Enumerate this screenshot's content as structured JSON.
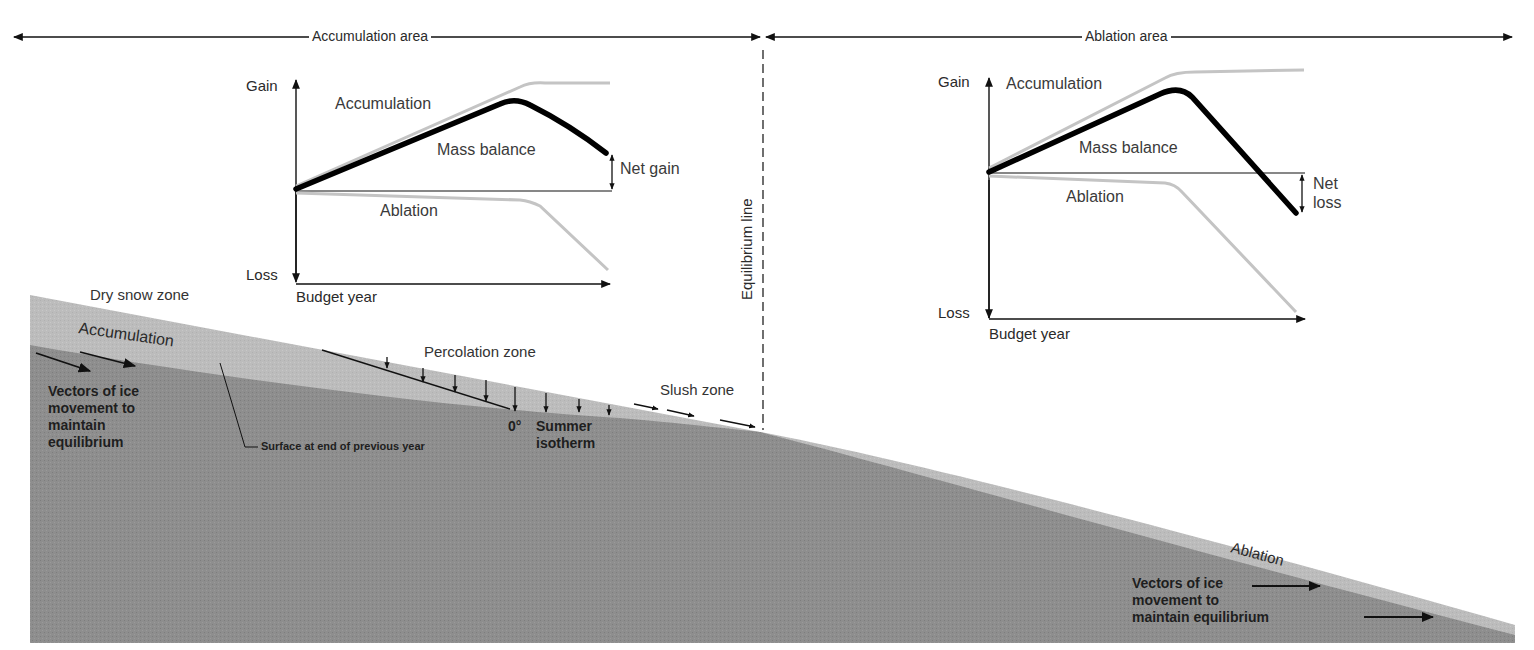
{
  "diagram": {
    "header": {
      "accumulation_area": "Accumulation area",
      "ablation_area": "Ablation area"
    },
    "equilibrium_line": "Equilibrium line",
    "left_chart": {
      "y_top": "Gain",
      "y_bottom": "Loss",
      "x_label": "Budget year",
      "accumulation": "Accumulation",
      "mass_balance": "Mass balance",
      "ablation": "Ablation",
      "result": "Net gain"
    },
    "right_chart": {
      "y_top": "Gain",
      "y_bottom": "Loss",
      "x_label": "Budget year",
      "accumulation": "Accumulation",
      "mass_balance": "Mass balance",
      "ablation": "Ablation",
      "result_line1": "Net",
      "result_line2": "loss"
    },
    "glacier": {
      "dry_snow_zone": "Dry snow zone",
      "accumulation": "Accumulation",
      "vectors_left": [
        "Vectors of ice",
        "movement to",
        "maintain",
        "equilibrium"
      ],
      "previous_surface": "Surface at end of previous year",
      "percolation_zone": "Percolation zone",
      "isotherm_deg": "0°",
      "isotherm_line1": "Summer",
      "isotherm_line2": "isotherm",
      "slush_zone": "Slush zone",
      "ablation": "Ablation",
      "vectors_right": [
        "Vectors of ice",
        "movement to",
        "maintain equilibrium"
      ]
    },
    "colors": {
      "ice_dark": "#8c8c8c",
      "snow_light": "#bdbdbd",
      "curve_gray": "#c4c4c4",
      "mass_balance": "#000000"
    }
  }
}
